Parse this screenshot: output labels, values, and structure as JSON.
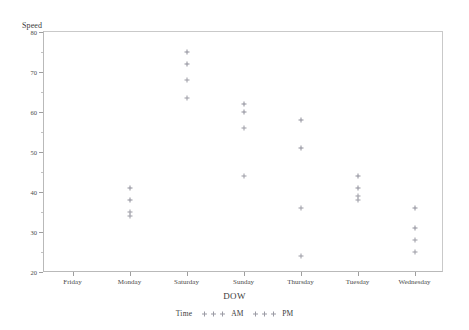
{
  "chart_data": {
    "type": "scatter",
    "title": "",
    "xlabel": "DOW",
    "ylabel": "Speed",
    "categories": [
      "Friday",
      "Monday",
      "Saturday",
      "Sunday",
      "Thursday",
      "Tuesday",
      "Wednesday"
    ],
    "ylim": [
      20,
      80
    ],
    "yticks": [
      20,
      30,
      40,
      50,
      60,
      70,
      80
    ],
    "ytick_labels": [
      "20",
      "30",
      "40",
      "50",
      "60",
      "70",
      "80"
    ],
    "yminor_step": 5,
    "grid": false,
    "legend_position": "bottom",
    "legend_title": "Time",
    "series": [
      {
        "name": "AM",
        "points": [
          {
            "x": "Monday",
            "y": 41
          },
          {
            "x": "Monday",
            "y": 38
          },
          {
            "x": "Saturday",
            "y": 75
          },
          {
            "x": "Saturday",
            "y": 72
          },
          {
            "x": "Sunday",
            "y": 62
          },
          {
            "x": "Sunday",
            "y": 60
          },
          {
            "x": "Thursday",
            "y": 58
          },
          {
            "x": "Thursday",
            "y": 51
          },
          {
            "x": "Tuesday",
            "y": 44
          },
          {
            "x": "Tuesday",
            "y": 41
          },
          {
            "x": "Wednesday",
            "y": 36
          },
          {
            "x": "Wednesday",
            "y": 31
          }
        ]
      },
      {
        "name": "PM",
        "points": [
          {
            "x": "Monday",
            "y": 35
          },
          {
            "x": "Monday",
            "y": 34
          },
          {
            "x": "Saturday",
            "y": 68
          },
          {
            "x": "Saturday",
            "y": 63.5
          },
          {
            "x": "Sunday",
            "y": 56
          },
          {
            "x": "Sunday",
            "y": 44
          },
          {
            "x": "Thursday",
            "y": 36
          },
          {
            "x": "Thursday",
            "y": 24
          },
          {
            "x": "Tuesday",
            "y": 39
          },
          {
            "x": "Tuesday",
            "y": 38
          },
          {
            "x": "Wednesday",
            "y": 28
          },
          {
            "x": "Wednesday",
            "y": 25
          }
        ]
      }
    ]
  },
  "axes": {
    "y_title": "Speed",
    "x_title": "DOW"
  },
  "legend": {
    "title": "Time",
    "entries": [
      {
        "label": "AM"
      },
      {
        "label": "PM"
      }
    ]
  },
  "colors": {
    "marker_am": "#8e8e99",
    "marker_pm": "#9a9aa4",
    "axis": "#9e9e9e",
    "frame": "#c9c9c9",
    "text": "#3a3a3a",
    "background": "#ffffff"
  }
}
